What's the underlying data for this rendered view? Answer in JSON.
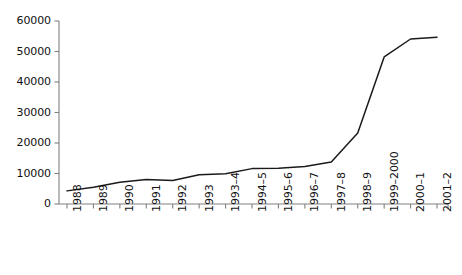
{
  "chart_data": {
    "type": "line",
    "title": "",
    "subtitle": "",
    "xlabel": "",
    "ylabel": "",
    "categories": [
      "1988",
      "1989",
      "1990",
      "1991",
      "1992",
      "1993",
      "1993–4",
      "1994–5",
      "1995–6",
      "1996–7",
      "1997–8",
      "1998–9",
      "1999–2000",
      "2000–1",
      "2001–2"
    ],
    "values": [
      4300,
      5500,
      7100,
      8000,
      7700,
      9600,
      9900,
      11600,
      11700,
      12300,
      13800,
      23300,
      48200,
      54100,
      54700
    ],
    "series": [
      {
        "name": "",
        "values": [
          4300,
          5500,
          7100,
          8000,
          7700,
          9600,
          9900,
          11600,
          11700,
          12300,
          13800,
          23300,
          48200,
          54100,
          54700
        ]
      }
    ],
    "ylim": [
      0,
      60000
    ],
    "ytick_labels": [
      "0",
      "10000",
      "20000",
      "30000",
      "40000",
      "50000",
      "60000"
    ],
    "ytick_values": [
      0,
      10000,
      20000,
      30000,
      40000,
      50000,
      60000
    ],
    "grid": false,
    "legend": false,
    "legend_position": "none",
    "line_color": "#1a1a1a",
    "axis_color": "#808080",
    "text_color": "#111111",
    "background": "#ffffff",
    "xtick_rotation": -90,
    "markers": false
  }
}
